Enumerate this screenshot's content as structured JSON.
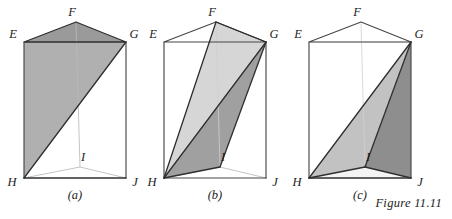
{
  "figure": {
    "caption": "Figure 11.11",
    "background_color": "#ffffff",
    "edge_color": "#474747",
    "colors": {
      "gray_medium": "#b0b0b0",
      "gray_light": "#d6d6d6",
      "gray_dark": "#a0a0a0",
      "gray_darker": "#8e8e8e",
      "top_face": "#9a9a9a",
      "bottom_face": "#f4f4f4",
      "hidden_edge": "#b9b9b9"
    },
    "panels": [
      {
        "id": "a",
        "label": "(a)",
        "vertex_labels": [
          {
            "name": "E",
            "text": "E",
            "x": 13,
            "y": 38
          },
          {
            "name": "F",
            "text": "F",
            "x": 72,
            "y": 16
          },
          {
            "name": "G",
            "text": "G",
            "x": 129,
            "y": 38
          },
          {
            "name": "H",
            "text": "H",
            "x": 12,
            "y": 186
          },
          {
            "name": "I",
            "text": "I",
            "x": 82,
            "y": 161
          },
          {
            "name": "J",
            "text": "J",
            "x": 131,
            "y": 186
          }
        ],
        "shaded_faces": [
          {
            "name": "top-face-EFG",
            "points": "24,42 76,22 126,42",
            "fill": "#9a9a9a"
          },
          {
            "name": "diagonal-plane-HEG",
            "points": "24,42 126,42 24,178",
            "fill": "#b0b0b0"
          }
        ]
      },
      {
        "id": "b",
        "label": "(b)",
        "vertex_labels": [
          {
            "name": "E",
            "text": "E",
            "x": 13,
            "y": 38
          },
          {
            "name": "F",
            "text": "F",
            "x": 72,
            "y": 16
          },
          {
            "name": "G",
            "text": "G",
            "x": 129,
            "y": 38
          },
          {
            "name": "H",
            "text": "H",
            "x": 12,
            "y": 186
          },
          {
            "name": "I",
            "text": "I",
            "x": 82,
            "y": 161
          },
          {
            "name": "J",
            "text": "J",
            "x": 131,
            "y": 186
          }
        ],
        "shaded_faces": [
          {
            "name": "triangle-HFG",
            "points": "24,178 76,22 126,42",
            "fill": "#d6d6d6"
          },
          {
            "name": "triangle-HGI",
            "points": "24,178 126,42 80,167",
            "fill": "#a0a0a0"
          }
        ]
      },
      {
        "id": "c",
        "label": "(c)",
        "vertex_labels": [
          {
            "name": "E",
            "text": "E",
            "x": 13,
            "y": 38
          },
          {
            "name": "F",
            "text": "F",
            "x": 72,
            "y": 16
          },
          {
            "name": "G",
            "text": "G",
            "x": 129,
            "y": 38
          },
          {
            "name": "H",
            "text": "H",
            "x": 12,
            "y": 186
          },
          {
            "name": "I",
            "text": "I",
            "x": 82,
            "y": 161
          },
          {
            "name": "J",
            "text": "J",
            "x": 131,
            "y": 186
          }
        ],
        "shaded_faces": [
          {
            "name": "triangle-HGI",
            "points": "24,178 126,42 80,167",
            "fill": "#c2c2c2"
          },
          {
            "name": "triangle-GIJ",
            "points": "126,42 80,167 126,178",
            "fill": "#8e8e8e"
          },
          {
            "name": "bottom-face-HIJ",
            "points": "24,178 80,167 126,178",
            "fill": "#f4f4f4"
          }
        ]
      }
    ]
  }
}
